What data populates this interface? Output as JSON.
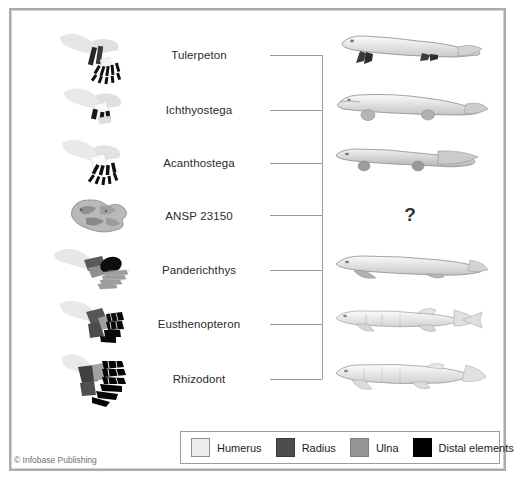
{
  "figure": {
    "unknown_marker": "?",
    "copyright": "© Infobase Publishing"
  },
  "taxa": [
    {
      "label": "Tulerpeton",
      "limb_icon": "tulerpeton-limb-fossil",
      "organism_icon": "tulerpeton-body",
      "has_organism": true
    },
    {
      "label": "Ichthyostega",
      "limb_icon": "ichthyostega-limb-fossil",
      "organism_icon": "ichthyostega-body",
      "has_organism": true
    },
    {
      "label": "Acanthostega",
      "limb_icon": "acanthostega-limb-fossil",
      "organism_icon": "acanthostega-body",
      "has_organism": true
    },
    {
      "label": "ANSP 23150",
      "limb_icon": "ansp-23150-fossil",
      "organism_icon": "unknown-body",
      "has_organism": false
    },
    {
      "label": "Panderichthys",
      "limb_icon": "panderichthys-fin-fossil",
      "organism_icon": "panderichthys-body",
      "has_organism": true
    },
    {
      "label": "Eusthenopteron",
      "limb_icon": "eusthenopteron-fin-fossil",
      "organism_icon": "eusthenopteron-body",
      "has_organism": true
    },
    {
      "label": "Rhizodont",
      "limb_icon": "rhizodont-fin-fossil",
      "organism_icon": "rhizodont-body",
      "has_organism": true
    }
  ],
  "legend": {
    "items": [
      {
        "label": "Humerus",
        "color": "#ededed"
      },
      {
        "label": "Radius",
        "color": "#4d4d4d"
      },
      {
        "label": "Ulna",
        "color": "#959595"
      },
      {
        "label": "Distal elements",
        "color": "#000000"
      }
    ]
  },
  "colors": {
    "frame": "#a9abad",
    "line": "#9a9c9e",
    "text": "#2b2b2b",
    "humerus": "#ededed",
    "radius": "#4d4d4d",
    "ulna": "#959595",
    "distal": "#000000",
    "background": "#ffffff"
  }
}
